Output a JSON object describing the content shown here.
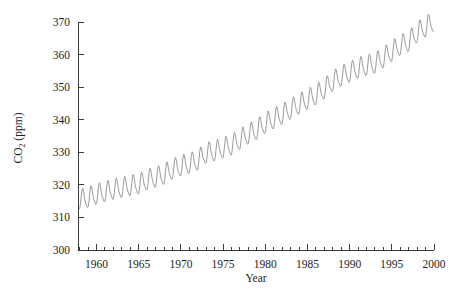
{
  "figure": {
    "background_color": "#ffffff",
    "axis_color": "#3a3a3a",
    "line_color": "#8e8e8e",
    "text_color": "#1c1c1c"
  },
  "axes": {
    "y_title_main": "CO",
    "y_title_sub": "2",
    "y_title_unit": " (ppm)",
    "x_title": "Year"
  },
  "chart_data": {
    "type": "line",
    "title": "",
    "subtitle": "",
    "xlabel": "Year",
    "ylabel": "CO2 (ppm)",
    "xlim": [
      1957.8,
      2000.0
    ],
    "ylim": [
      300,
      370
    ],
    "grid": false,
    "legend": null,
    "x_ticks": [
      1960,
      1965,
      1970,
      1975,
      1980,
      1985,
      1990,
      1995,
      2000
    ],
    "x_tick_labels": [
      "1960",
      "1965",
      "1970",
      "1975",
      "1980",
      "1985",
      "1990",
      "1995",
      "2000"
    ],
    "x_minor_tick_step": 1,
    "y_ticks": [
      300,
      310,
      320,
      330,
      340,
      350,
      360,
      370
    ],
    "y_tick_labels": [
      "300",
      "310",
      "320",
      "330",
      "340",
      "350",
      "360",
      "370"
    ],
    "series": [
      {
        "name": "Mauna Loa monthly mean CO2",
        "description": "Monthly atmospheric CO2 concentration showing rising trend with annual seasonal cycle",
        "annual_mean_x": [
          1958,
          1959,
          1960,
          1961,
          1962,
          1963,
          1964,
          1965,
          1966,
          1967,
          1968,
          1969,
          1970,
          1971,
          1972,
          1973,
          1974,
          1975,
          1976,
          1977,
          1978,
          1979,
          1980,
          1981,
          1982,
          1983,
          1984,
          1985,
          1986,
          1987,
          1988,
          1989,
          1990,
          1991,
          1992,
          1993,
          1994,
          1995,
          1996,
          1997,
          1998,
          1999
        ],
        "annual_mean_y": [
          315.3,
          315.9,
          316.9,
          317.6,
          318.4,
          318.9,
          319.5,
          320.0,
          321.3,
          322.1,
          323.0,
          324.6,
          325.6,
          326.3,
          327.4,
          329.6,
          330.1,
          331.1,
          332.0,
          333.8,
          335.4,
          336.8,
          338.7,
          340.1,
          341.4,
          343.0,
          344.6,
          346.0,
          347.4,
          349.2,
          351.6,
          353.1,
          354.4,
          355.6,
          356.4,
          357.1,
          358.8,
          360.8,
          362.6,
          363.8,
          366.6,
          368.3
        ],
        "seasonal_amplitude_ppm": 3.0,
        "seasonal_peak_month": 5,
        "seasonal_trough_month": 10,
        "y_first": 315.3,
        "y_last": 368.3,
        "y_min_observed": 313.0,
        "y_max_observed": 371.2
      }
    ]
  }
}
